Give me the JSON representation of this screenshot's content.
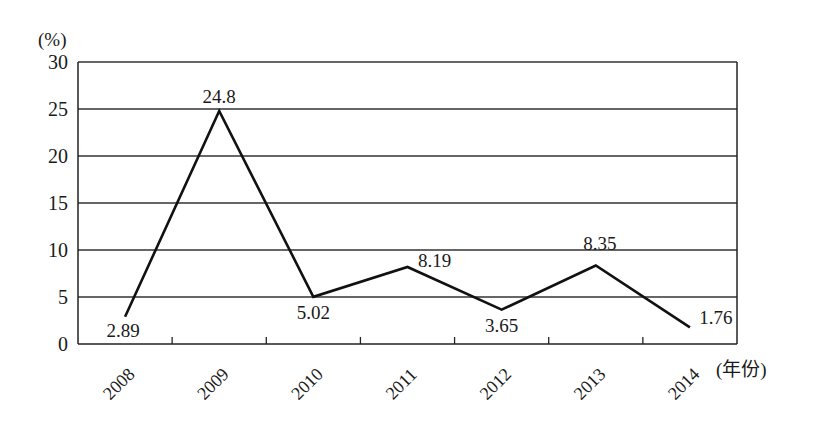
{
  "chart_data": {
    "type": "line",
    "title": "",
    "ylabel": "(%)",
    "xlabel": "(年份)",
    "categories": [
      "2008",
      "2009",
      "2010",
      "2011",
      "2012",
      "2013",
      "2014"
    ],
    "series": [
      {
        "name": "",
        "values": [
          2.89,
          24.8,
          5.02,
          8.19,
          3.65,
          8.35,
          1.76
        ]
      }
    ],
    "data_labels": [
      "2.89",
      "24.8",
      "5.02",
      "8.19",
      "3.65",
      "8.35",
      "1.76"
    ],
    "ylim": [
      0,
      30
    ],
    "yticks": [
      0,
      5,
      10,
      15,
      20,
      25,
      30
    ],
    "ytick_labels": [
      "0",
      "5",
      "10",
      "15",
      "20",
      "25",
      "30"
    ],
    "grid": "horizontal",
    "legend": null
  }
}
